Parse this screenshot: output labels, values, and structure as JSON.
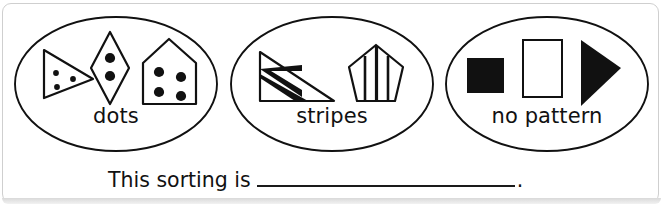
{
  "worksheet": {
    "sentence_prefix": "This sorting is",
    "sentence_blank": "",
    "sentence_period": ".",
    "ink_color": "#111111",
    "frame_color": "#cfcfcf"
  },
  "groups": [
    {
      "label": "dots",
      "shapes": [
        {
          "name": "triangle-with-three-dots",
          "kind": "triangle",
          "fill": "white",
          "pattern": "dots",
          "dot_count": 3
        },
        {
          "name": "rhombus-with-two-dots",
          "kind": "rhombus",
          "fill": "white",
          "pattern": "dots",
          "dot_count": 2
        },
        {
          "name": "pentagon-house-with-four-dots",
          "kind": "house",
          "fill": "white",
          "pattern": "dots",
          "dot_count": 4
        }
      ]
    },
    {
      "label": "stripes",
      "shapes": [
        {
          "name": "right-triangle-with-stripes",
          "kind": "right-triangle",
          "fill": "white",
          "pattern": "stripes",
          "stripe_count": 2
        },
        {
          "name": "pentagon-with-vertical-stripes",
          "kind": "pentagon",
          "fill": "white",
          "pattern": "stripes",
          "stripe_count": 2
        }
      ]
    },
    {
      "label": "no pattern",
      "shapes": [
        {
          "name": "black-square",
          "kind": "square",
          "fill": "black",
          "pattern": "none"
        },
        {
          "name": "white-rectangle",
          "kind": "rectangle",
          "fill": "white",
          "pattern": "none"
        },
        {
          "name": "black-triangle",
          "kind": "triangle-right",
          "fill": "black",
          "pattern": "none"
        }
      ]
    }
  ]
}
